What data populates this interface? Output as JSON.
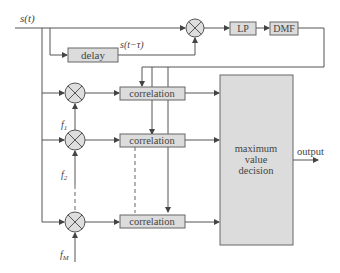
{
  "diagram": {
    "title": "",
    "input_signal": "s(t)",
    "delayed_signal": "s(t−τ)",
    "blocks": {
      "delay": "delay",
      "lowpass": "LP",
      "dmf": "DMF",
      "correlation": [
        "correlation",
        "correlation",
        "correlation"
      ],
      "decision_line1": "maximum",
      "decision_line2": "value",
      "decision_line3": "decision"
    },
    "frequencies": {
      "f1": "f",
      "f1_sub": "1",
      "f2": "f",
      "f2_sub": "2",
      "fM": "f",
      "fM_sub": "M"
    },
    "output_label": "output",
    "icons": {
      "multiplier": "circled-x-multiplier-icon",
      "arrow": "arrowhead-icon"
    },
    "colors": {
      "block_fill": "#dcdcdc",
      "line": "#555555",
      "text": "#444444"
    }
  }
}
